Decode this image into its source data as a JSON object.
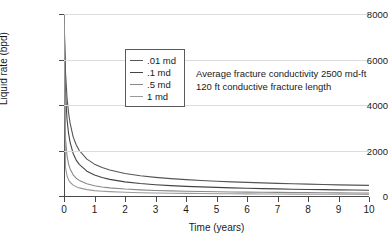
{
  "chart_data": {
    "type": "line",
    "title": "",
    "xlabel": "Time (years)",
    "ylabel": "Liquid rate (bpd)",
    "xlim": [
      0,
      10
    ],
    "ylim": [
      0,
      8000
    ],
    "xticks": [
      0,
      1,
      2,
      3,
      4,
      5,
      6,
      7,
      8,
      9,
      10
    ],
    "yticks": [
      0,
      2000,
      4000,
      6000,
      8000
    ],
    "grid": "horizontal",
    "legend_position": "upper-center-left",
    "annotations": [
      "Average fracture conductivity 2500 md-ft",
      "120 ft conductive fracture length"
    ],
    "x": [
      0,
      0.05,
      0.1,
      0.15,
      0.2,
      0.3,
      0.4,
      0.5,
      0.75,
      1,
      1.25,
      1.5,
      2,
      2.5,
      3,
      3.5,
      4,
      4.5,
      5,
      5.5,
      6,
      6.5,
      7,
      7.5,
      8,
      8.5,
      9,
      9.5,
      10
    ],
    "series": [
      {
        "name": ".01 md",
        "color": "#555555",
        "values": [
          8000,
          5400,
          4300,
          3650,
          3200,
          2600,
          2250,
          2000,
          1620,
          1400,
          1250,
          1140,
          990,
          890,
          820,
          765,
          720,
          683,
          650,
          622,
          597,
          575,
          555,
          537,
          520,
          505,
          491,
          478,
          466
        ]
      },
      {
        "name": ".1 md",
        "color": "#444444",
        "values": [
          8000,
          4500,
          3350,
          2750,
          2360,
          1870,
          1580,
          1390,
          1090,
          920,
          810,
          730,
          620,
          548,
          496,
          457,
          425,
          399,
          377,
          358,
          341,
          326,
          312,
          300,
          289,
          279,
          269,
          261,
          253
        ]
      },
      {
        "name": ".5 md",
        "color": "#888888",
        "values": [
          8000,
          2500,
          1750,
          1400,
          1190,
          930,
          782,
          685,
          536,
          452,
          398,
          359,
          305,
          270,
          245,
          226,
          211,
          198,
          188,
          179,
          171,
          164,
          158,
          152,
          147,
          143,
          139,
          135,
          131
        ]
      },
      {
        "name": "1 md",
        "color": "#9a9a9a",
        "values": [
          8000,
          1250,
          880,
          710,
          605,
          478,
          404,
          356,
          281,
          238,
          211,
          191,
          163,
          145,
          132,
          122,
          114,
          108,
          102,
          97,
          93,
          89,
          86,
          83,
          80,
          78,
          76,
          74,
          72
        ]
      }
    ]
  }
}
